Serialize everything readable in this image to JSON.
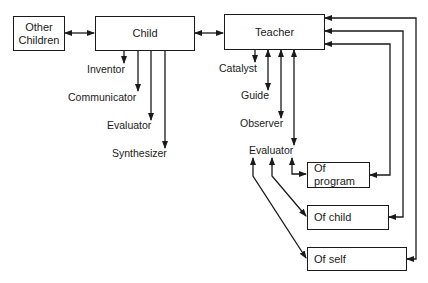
{
  "diagram": {
    "nodes": {
      "other_children": "Other Children",
      "other_children_line1": "Other",
      "other_children_line2": "Children",
      "child": "Child",
      "teacher": "Teacher",
      "of_program": "Of program",
      "of_child": "Of child",
      "of_self": "Of self"
    },
    "child_roles": [
      "Inventor",
      "Communicator",
      "Evaluator",
      "Synthesizer"
    ],
    "teacher_roles": [
      "Catalyst",
      "Guide",
      "Observer",
      "Evaluator"
    ],
    "edges": [
      {
        "from": "Other Children",
        "to": "Child",
        "type": "bidirectional"
      },
      {
        "from": "Child",
        "to": "Teacher",
        "type": "bidirectional"
      },
      {
        "from": "Child",
        "to": "Inventor",
        "type": "directed"
      },
      {
        "from": "Child",
        "to": "Communicator",
        "type": "directed"
      },
      {
        "from": "Child",
        "to": "Evaluator",
        "type": "directed"
      },
      {
        "from": "Child",
        "to": "Synthesizer",
        "type": "directed"
      },
      {
        "from": "Teacher",
        "to": "Catalyst",
        "type": "directed"
      },
      {
        "from": "Teacher",
        "to": "Guide",
        "type": "bidirectional"
      },
      {
        "from": "Teacher",
        "to": "Observer",
        "type": "bidirectional"
      },
      {
        "from": "Teacher",
        "to": "Evaluator",
        "type": "bidirectional"
      },
      {
        "from": "Evaluator",
        "to": "Of program",
        "type": "bidirectional"
      },
      {
        "from": "Evaluator",
        "to": "Of child",
        "type": "bidirectional"
      },
      {
        "from": "Evaluator",
        "to": "Of self",
        "type": "bidirectional"
      },
      {
        "from": "Of program",
        "to": "Teacher",
        "type": "bidirectional"
      },
      {
        "from": "Of child",
        "to": "Teacher",
        "type": "bidirectional"
      },
      {
        "from": "Of self",
        "to": "Teacher",
        "type": "bidirectional"
      }
    ]
  }
}
